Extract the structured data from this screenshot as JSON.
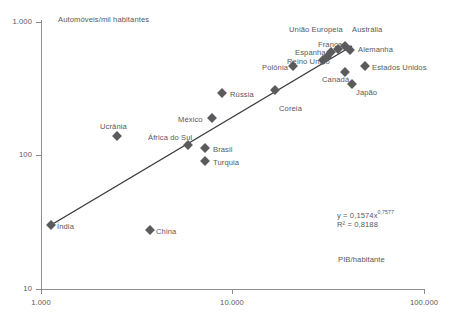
{
  "chart_data": {
    "type": "scatter",
    "title": "",
    "ylabel": "Automóveis/mil habitantes",
    "xlabel": "PIB/habitante",
    "xscale": "log",
    "yscale": "log",
    "xlim": [
      1000,
      100000
    ],
    "ylim": [
      10,
      1000
    ],
    "xticks": [
      "1.000",
      "10.000",
      "100.000"
    ],
    "yticks": [
      "1.000",
      "100",
      "10"
    ],
    "grid": false,
    "legend": "none",
    "annotations": {
      "equation": "y = 0,1574x",
      "exponent": "0,7577",
      "r_squared": "R² = 0,8188"
    },
    "trendline": {
      "x_start": 1180,
      "y_start": 31,
      "x_end": 42000,
      "y_end": 430
    },
    "points": [
      {
        "label": "Índia",
        "x": 1180,
        "y": 31,
        "px": 51,
        "py": 225,
        "lx": 57,
        "ly": 222
      },
      {
        "label": "China",
        "x": 4100,
        "y": 28,
        "px": 150,
        "py": 230,
        "lx": 156,
        "ly": 227
      },
      {
        "label": "Ucrânia",
        "x": 3000,
        "y": 140,
        "px": 117,
        "py": 136,
        "lx": 100,
        "ly": 122
      },
      {
        "label": "África do Sul",
        "x": 7900,
        "y": 110,
        "px": 188,
        "py": 145,
        "lx": 148,
        "ly": 133
      },
      {
        "label": "Brasil",
        "x": 9400,
        "y": 103,
        "px": 205,
        "py": 148,
        "lx": 213,
        "ly": 145
      },
      {
        "label": "Turquia",
        "x": 9400,
        "y": 89,
        "px": 205,
        "py": 161,
        "lx": 213,
        "ly": 158
      },
      {
        "label": "México",
        "x": 10500,
        "y": 175,
        "px": 212,
        "py": 118,
        "lx": 178,
        "ly": 115
      },
      {
        "label": "Rússia",
        "x": 12500,
        "y": 215,
        "px": 222,
        "py": 93,
        "lx": 230,
        "ly": 90
      },
      {
        "label": "Coreia",
        "x": 22000,
        "y": 250,
        "px": 275,
        "py": 90,
        "lx": 279,
        "ly": 104
      },
      {
        "label": "Polônia",
        "x": 17500,
        "y": 400,
        "px": 293,
        "py": 66,
        "lx": 262,
        "ly": 63
      },
      {
        "label": "Reino Unido",
        "x": 30000,
        "y": 460,
        "px": 323,
        "py": 60,
        "lx": 287,
        "ly": 57
      },
      {
        "label": "Espanha",
        "x": 30500,
        "y": 475,
        "px": 327,
        "py": 57,
        "lx": 295,
        "ly": 48
      },
      {
        "label": "União Europeia",
        "x": 31000,
        "y": 510,
        "px": 331,
        "py": 52,
        "lx": 289,
        "ly": 25
      },
      {
        "label": "França",
        "x": 33500,
        "y": 520,
        "px": 338,
        "py": 49,
        "lx": 318,
        "ly": 40
      },
      {
        "label": "Austrália",
        "x": 36000,
        "y": 540,
        "px": 345,
        "py": 46,
        "lx": 352,
        "ly": 25
      },
      {
        "label": "Alemanha",
        "x": 38000,
        "y": 515,
        "px": 350,
        "py": 50,
        "lx": 358,
        "ly": 45
      },
      {
        "label": "Canadá",
        "x": 37000,
        "y": 430,
        "px": 345,
        "py": 72,
        "lx": 322,
        "ly": 75
      },
      {
        "label": "Estados Unidos",
        "x": 44000,
        "y": 450,
        "px": 365,
        "py": 66,
        "lx": 372,
        "ly": 63
      },
      {
        "label": "Japão",
        "x": 39000,
        "y": 370,
        "px": 352,
        "py": 84,
        "lx": 356,
        "ly": 88
      }
    ]
  },
  "axes": {
    "y_ticks": [
      {
        "label": "1.000",
        "py": 22
      },
      {
        "label": "100",
        "py": 155
      },
      {
        "label": "10",
        "py": 289
      }
    ],
    "x_ticks": [
      {
        "label": "1.000",
        "px": 41
      },
      {
        "label": "10.000",
        "px": 232
      },
      {
        "label": "100.000",
        "px": 424
      }
    ]
  }
}
